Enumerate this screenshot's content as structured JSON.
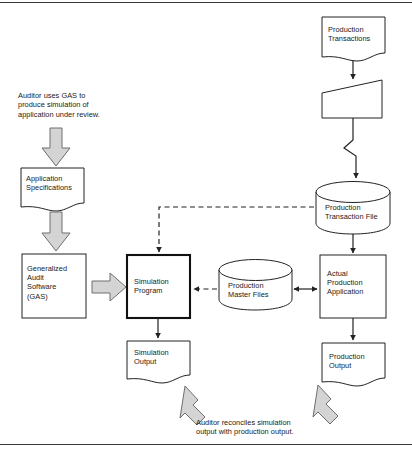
{
  "diagram": {
    "stroke_color": "#222222",
    "fill_color": "#ffffff",
    "block_arrow_fill": "#d4d4d4",
    "block_arrow_stroke": "#6e6e6e"
  },
  "notes": {
    "top_left": "Auditor uses GAS to\nproduce simulation of\napplication under review.",
    "bottom_center": "Auditor reconciles simulation\noutput with production output."
  },
  "nodes": {
    "application_specifications": {
      "label": "Application\nSpecifications",
      "shape": "document"
    },
    "generalized_audit_software": {
      "label": "Generalized\nAudit\nSoftware\n(GAS)",
      "shape": "process"
    },
    "simulation_program": {
      "label": "Simulation\nProgram",
      "shape": "process-bold"
    },
    "simulation_output": {
      "label": "Simulation\nOutput",
      "shape": "document"
    },
    "production_transactions": {
      "label": "Production\nTransactions",
      "shape": "document"
    },
    "manual_input": {
      "label": "",
      "shape": "manual-input"
    },
    "production_transaction_file": {
      "label": "Production\nTransaction File",
      "shape": "cylinder"
    },
    "production_master_files": {
      "label": "Production\nMaster Files",
      "shape": "cylinder"
    },
    "actual_production_application": {
      "label": "Actual\nProduction\nApplication",
      "shape": "process"
    },
    "production_output": {
      "label": "Production\nOutput",
      "shape": "document"
    }
  },
  "connectors": [
    {
      "name": "note-to-app-specs",
      "style": "block-arrow",
      "direction": "down"
    },
    {
      "name": "app-specs-to-gas",
      "style": "block-arrow",
      "direction": "down"
    },
    {
      "name": "gas-to-simulation-program",
      "style": "block-arrow",
      "direction": "right"
    },
    {
      "name": "simulation-program-to-simulation-output",
      "style": "solid",
      "direction": "down"
    },
    {
      "name": "production-transactions-to-manual-input",
      "style": "solid",
      "direction": "down"
    },
    {
      "name": "manual-input-to-transaction-file",
      "style": "solid-zigzag",
      "direction": "down"
    },
    {
      "name": "transaction-file-to-actual-production-application",
      "style": "solid",
      "direction": "down"
    },
    {
      "name": "transaction-file-to-simulation-program",
      "style": "dashed",
      "direction": "left-down"
    },
    {
      "name": "master-files-to-simulation-program",
      "style": "dashed",
      "direction": "left"
    },
    {
      "name": "master-files-to-actual-production-application",
      "style": "solid",
      "direction": "both"
    },
    {
      "name": "actual-production-application-to-production-output",
      "style": "solid",
      "direction": "down"
    },
    {
      "name": "note-to-simulation-output",
      "style": "block-arrow",
      "direction": "up-left"
    },
    {
      "name": "note-to-production-output",
      "style": "block-arrow",
      "direction": "up-left"
    }
  ]
}
